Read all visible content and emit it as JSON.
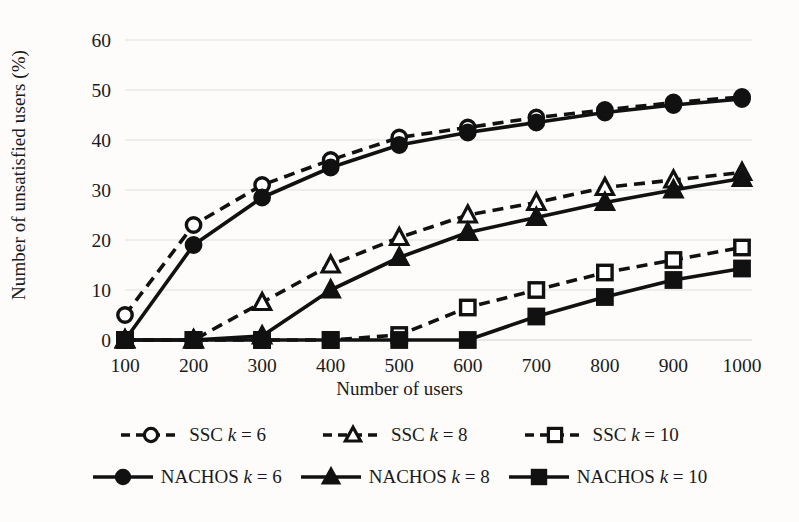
{
  "chart_data": {
    "type": "line",
    "title": "",
    "xlabel": "Number of users",
    "ylabel": "Number of unsatisfied users (%)",
    "x": [
      100,
      200,
      300,
      400,
      500,
      600,
      700,
      800,
      900,
      1000
    ],
    "xtick_labels": [
      "100",
      "200",
      "300",
      "400",
      "500",
      "600",
      "700",
      "800",
      "900",
      "1000"
    ],
    "ytick_labels": [
      "0",
      "10",
      "20",
      "30",
      "40",
      "50",
      "60"
    ],
    "yticks": [
      0,
      10,
      20,
      30,
      40,
      50,
      60
    ],
    "xlim": [
      100,
      1000
    ],
    "ylim": [
      0,
      60
    ],
    "grid": "horizontal",
    "legend_position": "bottom",
    "series": [
      {
        "name": "SSC k = 6",
        "label_prefix": "SSC",
        "label_k": "k",
        "label_suffix": "= 6",
        "style": "dashed",
        "marker": "circle-open",
        "color": "#111111",
        "values": [
          5,
          23,
          31,
          36,
          40.5,
          42.5,
          44.5,
          46,
          47.5,
          48.6
        ]
      },
      {
        "name": "SSC k = 8",
        "label_prefix": "SSC",
        "label_k": "k",
        "label_suffix": "= 8",
        "style": "dashed",
        "marker": "triangle-open",
        "color": "#111111",
        "values": [
          0,
          0,
          7.5,
          15,
          20.5,
          25,
          27.5,
          30.5,
          32,
          33.5
        ]
      },
      {
        "name": "SSC k = 10",
        "label_prefix": "SSC",
        "label_k": "k",
        "label_suffix": "= 10",
        "style": "dashed",
        "marker": "square-open",
        "color": "#111111",
        "values": [
          0,
          0,
          0,
          0,
          1,
          6.5,
          10,
          13.5,
          16,
          18.5
        ]
      },
      {
        "name": "NACHOS k = 6",
        "label_prefix": "NACHOS",
        "label_k": "k",
        "label_suffix": "= 6",
        "style": "solid",
        "marker": "circle-filled",
        "color": "#111111",
        "values": [
          0,
          19,
          28.5,
          34.5,
          39,
          41.5,
          43.5,
          45.5,
          47,
          48.2
        ]
      },
      {
        "name": "NACHOS k = 8",
        "label_prefix": "NACHOS",
        "label_k": "k",
        "label_suffix": "= 8",
        "style": "solid",
        "marker": "triangle-filled",
        "color": "#111111",
        "values": [
          0,
          0,
          0.8,
          10,
          16.5,
          21.5,
          24.5,
          27.5,
          30,
          32.3
        ]
      },
      {
        "name": "NACHOS k = 10",
        "label_prefix": "NACHOS",
        "label_k": "k",
        "label_suffix": "= 10",
        "style": "solid",
        "marker": "square-filled",
        "color": "#111111",
        "values": [
          0,
          0,
          0,
          0,
          0,
          0,
          4.7,
          8.6,
          12,
          14.3
        ]
      }
    ]
  },
  "legend": {
    "row1": [
      {
        "prefix": "SSC",
        "k": "k",
        "suffix": "= 6",
        "marker": "circle-open",
        "style": "dashed"
      },
      {
        "prefix": "SSC",
        "k": "k",
        "suffix": "= 8",
        "marker": "triangle-open",
        "style": "dashed"
      },
      {
        "prefix": "SSC",
        "k": "k",
        "suffix": "= 10",
        "marker": "square-open",
        "style": "dashed"
      }
    ],
    "row2": [
      {
        "prefix": "NACHOS",
        "k": "k",
        "suffix": "= 6",
        "marker": "circle-filled",
        "style": "solid"
      },
      {
        "prefix": "NACHOS",
        "k": "k",
        "suffix": "= 8",
        "marker": "triangle-filled",
        "style": "solid"
      },
      {
        "prefix": "NACHOS",
        "k": "k",
        "suffix": "= 10",
        "marker": "square-filled",
        "style": "solid"
      }
    ]
  },
  "colors": {
    "ink": "#111111",
    "grid": "#dedede",
    "background": "#fdfcfa"
  }
}
